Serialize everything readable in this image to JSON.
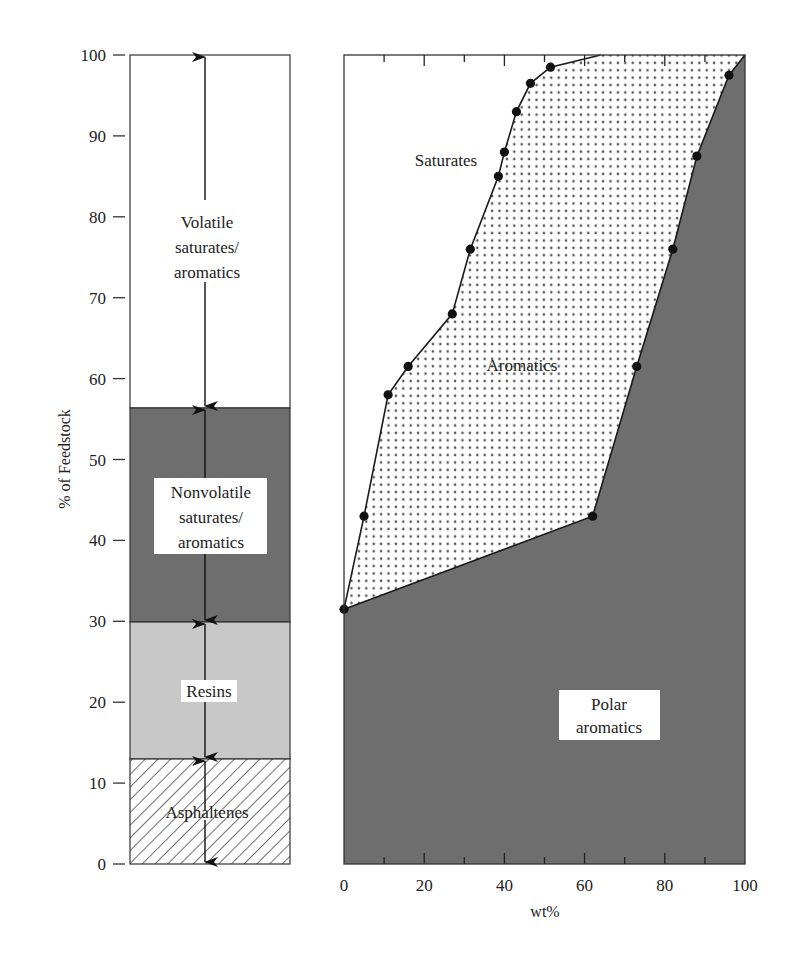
{
  "chart_data": [
    {
      "type": "stacked-bar",
      "title": "",
      "ylabel": "% of Feedstock",
      "ylim": [
        0,
        100
      ],
      "yticks": [
        0,
        10,
        20,
        30,
        40,
        50,
        60,
        70,
        80,
        90,
        100
      ],
      "segments": [
        {
          "name": "Asphaltenes",
          "from": 0,
          "to": 13,
          "fill": "hatched"
        },
        {
          "name": "Resins",
          "from": 13,
          "to": 30,
          "fill": "#c9c9c9"
        },
        {
          "name": "Nonvolatile saturates/ aromatics",
          "from": 30,
          "to": 56.5,
          "fill": "#6b6b6b"
        },
        {
          "name": "Volatile saturates/ aromatics",
          "from": 56.5,
          "to": 100,
          "fill": "#ffffff"
        }
      ]
    },
    {
      "type": "area",
      "xlabel": "wt%",
      "xlim": [
        0,
        100
      ],
      "ylim": [
        0,
        100
      ],
      "xticks": [
        0,
        20,
        40,
        60,
        80,
        100
      ],
      "regions": [
        "Saturates",
        "Aromatics",
        "Polar aromatics"
      ],
      "series": [
        {
          "name": "Saturates/Aromatics boundary",
          "points": [
            [
              0,
              31.5
            ],
            [
              5,
              43
            ],
            [
              11,
              58
            ],
            [
              16,
              61.5
            ],
            [
              27,
              68
            ],
            [
              31.5,
              76
            ],
            [
              38.5,
              85
            ],
            [
              40,
              88
            ],
            [
              43,
              93
            ],
            [
              46.5,
              96.5
            ],
            [
              51.5,
              98.5
            ],
            [
              64,
              100
            ]
          ]
        },
        {
          "name": "Aromatics/Polar aromatics boundary",
          "points": [
            [
              0,
              31.5
            ],
            [
              62,
              43
            ],
            [
              73,
              61.5
            ],
            [
              82,
              76
            ],
            [
              88,
              87.5
            ],
            [
              96,
              97.5
            ],
            [
              100,
              100
            ]
          ]
        }
      ]
    }
  ],
  "left_chart": {
    "ylabel": "% of Feedstock",
    "yticks": [
      "0",
      "10",
      "20",
      "30",
      "40",
      "50",
      "60",
      "70",
      "80",
      "90",
      "100"
    ],
    "labels": {
      "volatile": [
        "Volatile",
        "saturates/",
        "aromatics"
      ],
      "nonvolatile": [
        "Nonvolatile",
        "saturates/",
        "aromatics"
      ],
      "resins": "Resins",
      "asphaltenes": "Asphaltenes"
    }
  },
  "right_chart": {
    "xlabel": "wt%",
    "xticks": [
      "0",
      "20",
      "40",
      "60",
      "80",
      "100"
    ],
    "labels": {
      "saturates": "Saturates",
      "aromatics": "Aromatics",
      "polar": [
        "Polar",
        "aromatics"
      ]
    }
  },
  "colors": {
    "dark_fill": "#6e6e6e",
    "light_fill": "#c8c8c8",
    "line": "#1a1a1a",
    "dot_pattern": "#555555"
  }
}
